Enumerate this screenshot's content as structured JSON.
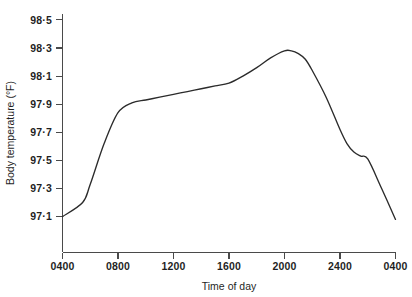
{
  "chart_data": {
    "type": "line",
    "title": "",
    "xlabel": "Time of day",
    "ylabel": "Body temperature (°F)",
    "grid": false,
    "legend": "none",
    "xlim": [
      400,
      2800
    ],
    "ylim": [
      97.0,
      98.6
    ],
    "x_tick_labels": [
      "0400",
      "0800",
      "1200",
      "1600",
      "2000",
      "2400",
      "0400"
    ],
    "x_tick_values": [
      400,
      800,
      1200,
      1600,
      2000,
      2400,
      2800
    ],
    "y_tick_labels": [
      "98·5",
      "98·3",
      "98·1",
      "97·9",
      "97·7",
      "97·5",
      "97·3",
      "97·1"
    ],
    "y_tick_values": [
      98.5,
      98.3,
      98.1,
      97.9,
      97.7,
      97.5,
      97.3,
      97.1
    ],
    "series": [
      {
        "name": "Body temperature",
        "color": "#2b2b2b",
        "x": [
          400,
          545,
          600,
          700,
          800,
          900,
          1000,
          1100,
          1200,
          1300,
          1400,
          1500,
          1600,
          1700,
          1800,
          1900,
          2000,
          2050,
          2100,
          2150,
          2200,
          2300,
          2400,
          2450,
          2500,
          2550,
          2600,
          2700,
          2800
        ],
        "values": [
          97.1,
          97.2,
          97.33,
          97.62,
          97.84,
          97.91,
          97.93,
          97.95,
          97.97,
          97.99,
          98.01,
          98.03,
          98.05,
          98.1,
          98.16,
          98.23,
          98.28,
          98.28,
          98.26,
          98.22,
          98.14,
          97.95,
          97.72,
          97.62,
          97.56,
          97.53,
          97.51,
          97.3,
          97.08
        ]
      }
    ],
    "annotations": []
  },
  "axes": {
    "y_axis_label": "Body temperature (°F)",
    "x_axis_label": "Time of day"
  }
}
